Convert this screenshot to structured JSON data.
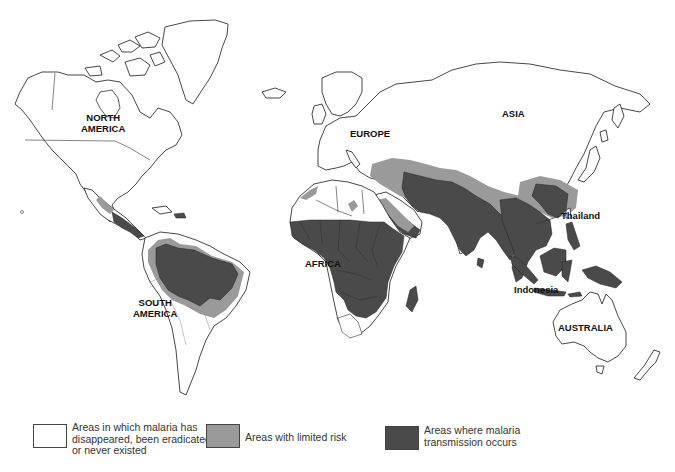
{
  "map": {
    "title": "World distribution of malaria",
    "colors": {
      "no_risk": "#ffffff",
      "limited_risk": "#9a9a9a",
      "transmission": "#4a4a4a",
      "outline": "#333333"
    },
    "labels": {
      "north_america": "NORTH\nAMERICA",
      "south_america": "SOUTH\nAMERICA",
      "europe": "EUROPE",
      "asia": "ASIA",
      "africa": "AFRICA",
      "australia": "AUSTRALIA",
      "thailand": "Thailand",
      "indonesia": "Indonesia"
    }
  },
  "legend": {
    "items": [
      {
        "key": "no_risk",
        "text": "Areas in which malaria has\ndisappeared, been eradicated,\nor never existed"
      },
      {
        "key": "limited_risk",
        "text": "Areas with limited risk"
      },
      {
        "key": "transmission",
        "text": "Areas where malaria\ntransmission occurs"
      }
    ]
  }
}
